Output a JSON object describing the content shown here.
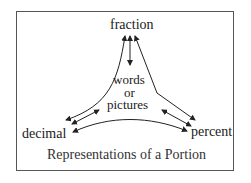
{
  "diagram": {
    "nodes": {
      "top": "fraction",
      "center_line1": "words",
      "center_line2": "or",
      "center_line3": "pictures",
      "left": "decimal",
      "right": "percent"
    },
    "caption": "Representations of a Portion",
    "edges": [
      {
        "from": "fraction",
        "to": "decimal",
        "type": "bidirectional-curve"
      },
      {
        "from": "fraction",
        "to": "percent",
        "type": "bidirectional-curve"
      },
      {
        "from": "fraction",
        "to": "words or pictures",
        "type": "bidirectional"
      },
      {
        "from": "decimal",
        "to": "words or pictures",
        "type": "bidirectional"
      },
      {
        "from": "percent",
        "to": "words or pictures",
        "type": "bidirectional"
      },
      {
        "from": "decimal",
        "to": "percent",
        "type": "bidirectional-curve"
      }
    ]
  }
}
